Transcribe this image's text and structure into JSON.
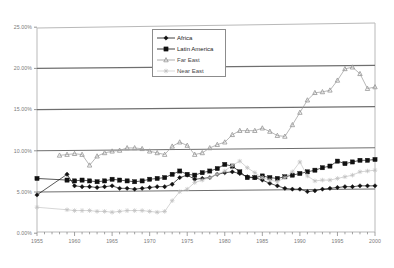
{
  "chart_data": {
    "type": "line",
    "title": "",
    "xlabel": "",
    "ylabel": "",
    "xlim": [
      1955,
      2000
    ],
    "ylim": [
      0,
      25
    ],
    "grid": true,
    "legend_position": "top-right",
    "y_ticks": [
      "0.00%",
      "5.00%",
      "10.00%",
      "15.00%",
      "20.00%",
      "25.00%"
    ],
    "y_tick_values": [
      0,
      5,
      10,
      15,
      20,
      25
    ],
    "x_ticks": [
      "1955",
      "1960",
      "1965",
      "1970",
      "1975",
      "1980",
      "1985",
      "1990",
      "1995",
      "2000"
    ],
    "x_tick_values": [
      1955,
      1960,
      1965,
      1970,
      1975,
      1980,
      1985,
      1990,
      1995,
      2000
    ],
    "series": [
      {
        "name": "Africa",
        "marker": "diamond",
        "color": "#111111",
        "x": [
          1955,
          1959,
          1960,
          1961,
          1962,
          1963,
          1964,
          1965,
          1966,
          1967,
          1968,
          1969,
          1970,
          1971,
          1972,
          1973,
          1974,
          1975,
          1976,
          1977,
          1978,
          1979,
          1980,
          1981,
          1982,
          1983,
          1984,
          1985,
          1986,
          1987,
          1988,
          1989,
          1990,
          1991,
          1992,
          1993,
          1994,
          1995,
          1996,
          1997,
          1998,
          1999,
          2000
        ],
        "y": [
          4.5,
          7.0,
          5.6,
          5.5,
          5.5,
          5.4,
          5.5,
          5.6,
          5.3,
          5.3,
          5.2,
          5.3,
          5.4,
          5.5,
          5.5,
          5.8,
          6.6,
          6.9,
          6.4,
          6.5,
          6.6,
          7.0,
          7.2,
          7.3,
          7.1,
          6.7,
          6.6,
          6.3,
          5.9,
          5.6,
          5.3,
          5.2,
          5.2,
          4.9,
          5.0,
          5.2,
          5.3,
          5.4,
          5.5,
          5.5,
          5.6,
          5.6,
          5.6
        ]
      },
      {
        "name": "Latin America",
        "marker": "square",
        "color": "#111111",
        "x": [
          1955,
          1959,
          1960,
          1961,
          1962,
          1963,
          1964,
          1965,
          1966,
          1967,
          1968,
          1969,
          1970,
          1971,
          1972,
          1973,
          1974,
          1975,
          1976,
          1977,
          1978,
          1979,
          1980,
          1981,
          1982,
          1983,
          1984,
          1985,
          1986,
          1987,
          1988,
          1989,
          1990,
          1991,
          1992,
          1993,
          1994,
          1995,
          1996,
          1997,
          1998,
          1999,
          2000
        ],
        "y": [
          6.5,
          6.3,
          6.2,
          6.3,
          6.2,
          6.1,
          6.2,
          6.4,
          6.3,
          6.2,
          6.1,
          6.2,
          6.4,
          6.5,
          6.6,
          7.0,
          7.4,
          7.0,
          6.9,
          7.2,
          7.4,
          7.7,
          8.2,
          8.0,
          7.3,
          6.6,
          6.6,
          6.8,
          6.6,
          6.5,
          6.7,
          6.9,
          7.1,
          7.3,
          7.5,
          7.8,
          8.0,
          8.6,
          8.3,
          8.5,
          8.7,
          8.7,
          8.8
        ]
      },
      {
        "name": "Far East",
        "marker": "triangle",
        "color": "#9a9a9a",
        "x": [
          1958,
          1959,
          1960,
          1961,
          1962,
          1963,
          1964,
          1965,
          1966,
          1967,
          1968,
          1969,
          1970,
          1971,
          1972,
          1973,
          1974,
          1975,
          1976,
          1977,
          1978,
          1979,
          1980,
          1981,
          1982,
          1983,
          1984,
          1985,
          1986,
          1987,
          1988,
          1989,
          1990,
          1991,
          1992,
          1993,
          1994,
          1995,
          1996,
          1997,
          1998,
          1999,
          2000
        ],
        "y": [
          9.3,
          9.4,
          9.5,
          9.4,
          8.1,
          9.2,
          9.6,
          9.8,
          9.9,
          10.2,
          10.2,
          10.1,
          9.8,
          9.6,
          9.4,
          10.4,
          10.9,
          10.5,
          9.4,
          9.6,
          10.2,
          10.6,
          10.9,
          11.8,
          12.3,
          12.3,
          12.3,
          12.6,
          12.2,
          11.7,
          11.6,
          13.0,
          14.5,
          16.0,
          16.9,
          17.0,
          17.2,
          18.4,
          19.8,
          20.0,
          19.2,
          17.4,
          17.6
        ]
      },
      {
        "name": "Near East",
        "marker": "star",
        "color": "#c0c0c0",
        "x": [
          1955,
          1959,
          1960,
          1961,
          1962,
          1963,
          1964,
          1965,
          1966,
          1967,
          1968,
          1969,
          1970,
          1971,
          1972,
          1973,
          1974,
          1975,
          1976,
          1977,
          1978,
          1979,
          1980,
          1981,
          1982,
          1983,
          1984,
          1985,
          1986,
          1987,
          1988,
          1989,
          1990,
          1991,
          1992,
          1993,
          1994,
          1995,
          1996,
          1997,
          1998,
          1999,
          2000
        ],
        "y": [
          3.0,
          2.7,
          2.6,
          2.6,
          2.6,
          2.5,
          2.5,
          2.4,
          2.5,
          2.6,
          2.6,
          2.6,
          2.5,
          2.4,
          2.5,
          3.8,
          4.9,
          5.2,
          6.0,
          6.3,
          6.6,
          7.0,
          7.4,
          8.1,
          8.6,
          7.8,
          7.2,
          6.6,
          6.3,
          6.1,
          6.6,
          7.3,
          8.5,
          6.8,
          6.2,
          6.3,
          6.3,
          6.5,
          6.7,
          6.9,
          7.3,
          7.4,
          7.5
        ]
      }
    ]
  },
  "legend": {
    "items": [
      {
        "label": "Africa",
        "marker": "diamond"
      },
      {
        "label": "Latin America",
        "marker": "square"
      },
      {
        "label": "Far East",
        "marker": "triangle"
      },
      {
        "label": "Near East",
        "marker": "star"
      }
    ]
  }
}
